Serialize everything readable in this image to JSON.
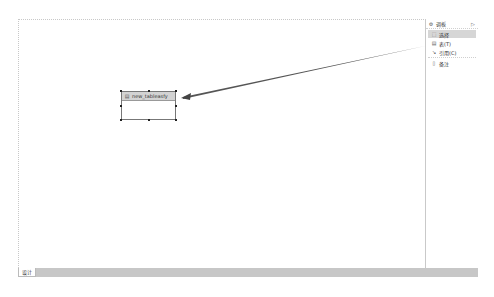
{
  "canvas": {
    "entity": {
      "name": "new_tableasfy",
      "icon": "table-icon"
    }
  },
  "palette": {
    "title": "调板",
    "icon": "palette-icon",
    "collapse_icon": "chevron-right-icon",
    "items": [
      {
        "label": "选择",
        "icon": "select-icon",
        "selected": true
      },
      {
        "label": "表(T)",
        "icon": "table-icon",
        "selected": false
      },
      {
        "label": "引用(C)",
        "icon": "reference-icon",
        "selected": false
      },
      {
        "label": "备注",
        "icon": "note-icon",
        "selected": false
      }
    ]
  },
  "bottom_tabs": [
    {
      "label": "设计",
      "active": true
    }
  ]
}
